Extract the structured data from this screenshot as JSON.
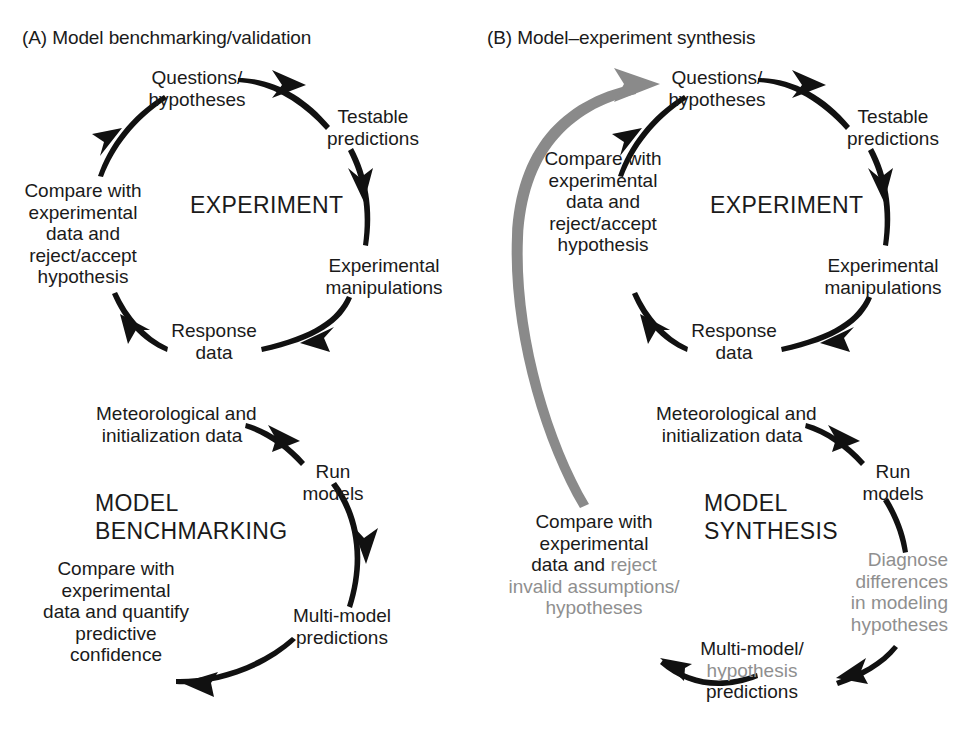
{
  "figure": {
    "background_color": "#ffffff",
    "text_color": "#1a1a1a",
    "accent_gray": "#8f8f8f"
  },
  "panels": {
    "a": {
      "title": "(A) Model benchmarking/validation",
      "experiment_cycle": {
        "hub": "EXPERIMENT",
        "nodes": {
          "questions": {
            "line1": "Questions/",
            "line2": "hypotheses"
          },
          "testable": {
            "line1": "Testable",
            "line2": "predictions"
          },
          "manipulations": {
            "line1": "Experimental",
            "line2": "manipulations"
          },
          "response": {
            "line1": "Response",
            "line2": "data"
          },
          "compare": {
            "line1": "Compare with",
            "line2": "experimental",
            "line3": "data and",
            "line4": "reject/accept",
            "line5": "hypothesis"
          }
        }
      },
      "model_cycle": {
        "hub_line1": "MODEL",
        "hub_line2": "BENCHMARKING",
        "nodes": {
          "meteorological": {
            "line1": "Meteorological and",
            "line2": "initialization data"
          },
          "run_models": {
            "line1": "Run",
            "line2": "models"
          },
          "multimodel": {
            "line1": "Multi-model",
            "line2": "predictions"
          },
          "compare": {
            "line1": "Compare with",
            "line2": "experimental",
            "line3": "data and quantify",
            "line4": "predictive",
            "line5": "confidence"
          }
        }
      }
    },
    "b": {
      "title": "(B) Model–experiment synthesis",
      "experiment_cycle": {
        "hub": "EXPERIMENT",
        "nodes": {
          "questions": {
            "line1": "Questions/",
            "line2": "hypotheses"
          },
          "testable": {
            "line1": "Testable",
            "line2": "predictions"
          },
          "manipulations": {
            "line1": "Experimental",
            "line2": "manipulations"
          },
          "response": {
            "line1": "Response",
            "line2": "data"
          },
          "compare": {
            "line1": "Compare with",
            "line2": "experimental",
            "line3": "data and",
            "line4": "reject/accept",
            "line5": "hypothesis"
          }
        }
      },
      "model_cycle": {
        "hub_line1": "MODEL",
        "hub_line2": "SYNTHESIS",
        "nodes": {
          "meteorological": {
            "line1": "Meteorological and",
            "line2": "initialization data"
          },
          "run_models": {
            "line1": "Run",
            "line2": "models"
          },
          "diagnose": {
            "line1": "Diagnose",
            "line2": "differences",
            "line3": "in modeling",
            "line4": "hypotheses"
          },
          "multimodel": {
            "line1": "Multi-model/",
            "line2": "hypothesis",
            "line3": "predictions"
          },
          "compare": {
            "line1": "Compare with",
            "line2": "experimental",
            "line3a": "data and ",
            "line3b": "reject",
            "line4": "invalid assumptions/",
            "line5": "hypotheses"
          }
        }
      },
      "feedback_arrow_label": "model-synthesis-to-questions"
    }
  }
}
